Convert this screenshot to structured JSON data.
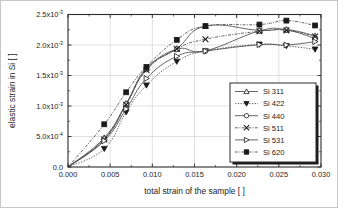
{
  "chart_data": {
    "type": "line",
    "title": "",
    "xlabel": "total strain of the sample [ ]",
    "ylabel": "elastic strain in Si [ ]",
    "xlim": [
      0.0,
      0.03
    ],
    "ylim": [
      0.0,
      0.0025
    ],
    "grid": true,
    "legend_position": "lower-right",
    "xticks": [
      0.0,
      0.005,
      0.01,
      0.015,
      0.02,
      0.025,
      0.03
    ],
    "xticklabels": [
      "0.000",
      "0.005",
      "0.010",
      "0.015",
      "0.020",
      "0.025",
      "0.030"
    ],
    "yticks": [
      0.0,
      0.0005,
      0.001,
      0.0015,
      0.002,
      0.0025
    ],
    "yticklabels": [
      "0.0",
      "5.0x10",
      "1.0x10",
      "1.5x10",
      "2.0x10",
      "2.5x10"
    ],
    "ytick_exponents": [
      "",
      "-4",
      "-3",
      "-3",
      "-3",
      "-3"
    ],
    "series": [
      {
        "name": "Si 311",
        "marker": "triangle-up-open",
        "linestyle": "solid",
        "x": [
          0.0,
          0.0043,
          0.0069,
          0.0093,
          0.0129,
          0.0163,
          0.0227,
          0.0259,
          0.0293
        ],
        "y": [
          0.0,
          0.00048,
          0.00104,
          0.00162,
          0.00194,
          0.00231,
          0.00224,
          0.002255,
          0.00215
        ]
      },
      {
        "name": "Si 422",
        "marker": "triangle-down-filled",
        "linestyle": "dotted",
        "x": [
          0.0,
          0.0043,
          0.0069,
          0.0093,
          0.0129,
          0.0163,
          0.0227,
          0.0259,
          0.0293
        ],
        "y": [
          0.0,
          0.0003,
          0.0009,
          0.00134,
          0.00173,
          0.0019,
          0.00201,
          0.001985,
          0.00193
        ]
      },
      {
        "name": "Si 440",
        "marker": "circle-open",
        "linestyle": "solid",
        "x": [
          0.0,
          0.0043,
          0.0069,
          0.0093,
          0.0129,
          0.0163,
          0.0227,
          0.0259,
          0.0293
        ],
        "y": [
          0.0,
          0.000455,
          0.00103,
          0.0016,
          0.00193,
          0.001905,
          0.00223,
          0.002245,
          0.002105
        ]
      },
      {
        "name": "Si 511",
        "marker": "x-cross",
        "linestyle": "dash-dot",
        "x": [
          0.0,
          0.0043,
          0.0069,
          0.0093,
          0.0129,
          0.0163,
          0.0227,
          0.0259,
          0.0293
        ],
        "y": [
          0.0,
          0.00045,
          0.00102,
          0.00159,
          0.001935,
          0.002095,
          0.002225,
          0.00224,
          0.00214
        ]
      },
      {
        "name": "Si 531",
        "marker": "triangle-right-open",
        "linestyle": "solid",
        "x": [
          0.0,
          0.0043,
          0.0069,
          0.0093,
          0.0129,
          0.0163,
          0.0227,
          0.0259,
          0.0293
        ],
        "y": [
          0.0,
          0.00043,
          0.00095,
          0.00145,
          0.001815,
          0.0019,
          0.002005,
          0.002,
          0.002055
        ]
      },
      {
        "name": "Si 620",
        "marker": "square-filled",
        "linestyle": "dash-dot",
        "x": [
          0.0,
          0.0043,
          0.0069,
          0.0093,
          0.0129,
          0.0163,
          0.0227,
          0.0259,
          0.0293
        ],
        "y": [
          0.0,
          0.0007,
          0.001225,
          0.00164,
          0.002085,
          0.00231,
          0.002335,
          0.0024,
          0.00232
        ]
      }
    ]
  },
  "legend": {
    "items": [
      {
        "label": "Si 311"
      },
      {
        "label": "Si 422"
      },
      {
        "label": "Si 440"
      },
      {
        "label": "Si 511"
      },
      {
        "label": "Si 531"
      },
      {
        "label": "Si 620"
      }
    ]
  }
}
